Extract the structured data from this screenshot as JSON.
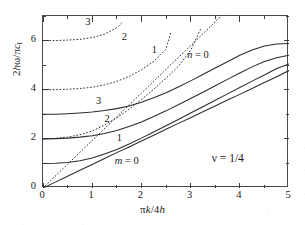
{
  "figure": {
    "kind": "dispersion-curve-plot",
    "background": "#ffffff",
    "ink": "#2b2b2b"
  },
  "axes": {
    "xlabel_parts": {
      "pi": "π",
      "k": "k",
      "slash": "/4",
      "h": "h"
    },
    "xlabel_text": "πk/4h",
    "ylabel_text": "2hω/πc_t",
    "ylabel_parts": {
      "two": "2",
      "h": "h",
      "omega": "ω",
      "slash": "/",
      "pi": "π",
      "c": "c",
      "sub": "t"
    },
    "xlim": [
      0,
      5
    ],
    "ylim": [
      0,
      7
    ],
    "xticks_major": [
      0,
      1,
      2,
      3,
      4,
      5
    ],
    "xticklabels": [
      "0",
      "1",
      "2",
      "3",
      "4",
      "5"
    ],
    "xticks_minor": [
      0.5,
      1.5,
      2.5,
      3.5,
      4.5
    ],
    "yticks_major": [
      0,
      2,
      4,
      6
    ],
    "yticklabels": [
      "0",
      "2",
      "4",
      "6"
    ],
    "yticks_minor": [
      1,
      3,
      5,
      7
    ],
    "grid": false,
    "frame": true
  },
  "annotations": {
    "poisson": "ν = 1/4",
    "dotted_family": [
      {
        "label": "n = 0",
        "italic_lead": "n",
        "x": 2.95,
        "y": 5.35
      },
      {
        "label": "1",
        "x": 2.23,
        "y": 5.55
      },
      {
        "label": "2",
        "x": 1.62,
        "y": 6.05
      },
      {
        "label": "3",
        "x": 0.88,
        "y": 6.68
      }
    ],
    "solid_family": [
      {
        "label": "m = 0",
        "italic_lead": "m",
        "x": 1.48,
        "y": 1.02
      },
      {
        "label": "1",
        "x": 1.52,
        "y": 1.95
      },
      {
        "label": "2",
        "x": 1.27,
        "y": 2.72
      },
      {
        "label": "3",
        "x": 1.1,
        "y": 3.45
      }
    ]
  },
  "chart_data": {
    "type": "line",
    "title": "",
    "subtitle": "",
    "xlabel": "πk/4h",
    "ylabel": "2hω/πc_t",
    "xlim": [
      0,
      5
    ],
    "ylim": [
      0,
      7
    ],
    "xticks": [
      0,
      1,
      2,
      3,
      4,
      5
    ],
    "yticks": [
      0,
      2,
      4,
      6
    ],
    "grid": false,
    "legend_position": "inline-labels",
    "annotations": [
      "ν = 1/4",
      "n = 0",
      "1",
      "2",
      "3",
      "m = 0",
      "1",
      "2",
      "3"
    ],
    "series": [
      {
        "name": "m = 0",
        "family": "solid",
        "style": "solid",
        "cutoff": 0.0,
        "x": [
          0.0,
          0.25,
          0.5,
          0.75,
          1.0,
          1.25,
          1.5,
          1.75,
          2.0,
          2.25,
          2.5,
          2.75,
          3.0,
          3.25,
          3.5,
          3.75,
          4.0,
          4.25,
          4.5,
          4.75,
          5.0
        ],
        "values": [
          0.0,
          0.24,
          0.48,
          0.72,
          0.96,
          1.2,
          1.44,
          1.67,
          1.91,
          2.15,
          2.39,
          2.63,
          2.86,
          3.1,
          3.34,
          3.58,
          3.81,
          4.05,
          4.29,
          4.53,
          4.78
        ]
      },
      {
        "name": "m = 1",
        "family": "solid",
        "style": "solid",
        "cutoff": 1.0,
        "x": [
          0.0,
          0.25,
          0.5,
          0.75,
          1.0,
          1.25,
          1.5,
          1.75,
          2.0,
          2.25,
          2.5,
          2.75,
          3.0,
          3.25,
          3.5,
          3.75,
          4.0,
          4.25,
          4.5,
          4.75,
          5.0
        ],
        "values": [
          1.0,
          1.01,
          1.04,
          1.11,
          1.22,
          1.38,
          1.57,
          1.79,
          2.03,
          2.28,
          2.53,
          2.79,
          3.05,
          3.31,
          3.57,
          3.83,
          4.09,
          4.35,
          4.6,
          4.86,
          5.05
        ]
      },
      {
        "name": "m = 2",
        "family": "solid",
        "style": "solid",
        "cutoff": 2.0,
        "x": [
          0.0,
          0.25,
          0.5,
          0.75,
          1.0,
          1.25,
          1.5,
          1.75,
          2.0,
          2.25,
          2.5,
          2.75,
          3.0,
          3.25,
          3.5,
          3.75,
          4.0,
          4.25,
          4.5,
          4.75,
          5.0
        ],
        "values": [
          2.0,
          2.01,
          2.03,
          2.07,
          2.13,
          2.22,
          2.34,
          2.5,
          2.69,
          2.91,
          3.14,
          3.39,
          3.64,
          3.9,
          4.16,
          4.42,
          4.68,
          4.93,
          5.15,
          5.3,
          5.4
        ]
      },
      {
        "name": "m = 3",
        "family": "solid",
        "style": "solid",
        "cutoff": 3.0,
        "x": [
          0.0,
          0.25,
          0.5,
          0.75,
          1.0,
          1.25,
          1.5,
          1.75,
          2.0,
          2.25,
          2.5,
          2.75,
          3.0,
          3.25,
          3.5,
          3.75,
          4.0,
          4.25,
          4.5,
          4.75,
          5.0
        ],
        "values": [
          3.0,
          3.0,
          3.02,
          3.05,
          3.09,
          3.15,
          3.23,
          3.34,
          3.49,
          3.67,
          3.88,
          4.11,
          4.36,
          4.62,
          4.88,
          5.14,
          5.4,
          5.62,
          5.78,
          5.86,
          5.88
        ]
      },
      {
        "name": "n = 0",
        "family": "dotted",
        "style": "dotted",
        "cutoff": 0.0,
        "x": [
          0.0,
          0.5,
          1.0,
          1.5,
          2.0,
          2.5,
          3.0,
          3.5,
          3.62
        ],
        "values": [
          0.0,
          0.97,
          1.93,
          2.9,
          3.86,
          4.83,
          5.79,
          6.76,
          7.0
        ]
      },
      {
        "name": "n = 1",
        "family": "dotted",
        "style": "dotted",
        "cutoff": 2.0,
        "x": [
          0.0,
          0.25,
          0.5,
          0.75,
          1.0,
          1.25,
          1.5,
          1.75,
          2.0,
          2.25,
          2.5,
          2.75,
          3.0,
          3.2
        ],
        "values": [
          2.0,
          2.02,
          2.07,
          2.17,
          2.32,
          2.56,
          2.86,
          3.2,
          3.6,
          4.02,
          4.47,
          4.95,
          5.6,
          6.45
        ]
      },
      {
        "name": "n = 2",
        "family": "dotted",
        "style": "dotted",
        "cutoff": 4.0,
        "x": [
          0.0,
          0.25,
          0.5,
          0.75,
          1.0,
          1.25,
          1.5,
          1.75,
          2.0,
          2.25,
          2.5,
          2.6
        ],
        "values": [
          4.0,
          4.0,
          4.02,
          4.05,
          4.1,
          4.2,
          4.34,
          4.54,
          4.81,
          5.15,
          5.65,
          6.35
        ]
      },
      {
        "name": "n = 3",
        "family": "dotted",
        "style": "dotted",
        "cutoff": 6.0,
        "x": [
          0.0,
          0.25,
          0.5,
          0.75,
          1.0,
          1.25,
          1.5,
          1.6
        ],
        "values": [
          6.0,
          6.0,
          6.02,
          6.05,
          6.12,
          6.26,
          6.52,
          6.72
        ]
      }
    ],
    "parameters": {
      "poisson_ratio": "1/4"
    }
  }
}
